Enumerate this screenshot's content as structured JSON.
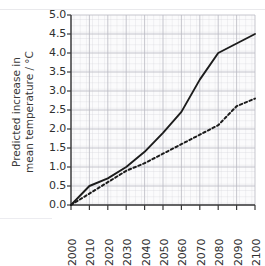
{
  "figure": {
    "cropped_top_text": "",
    "background_color": "#ffffff",
    "ink_color": "#2b2b2b",
    "grid_color": "#c9c9cf"
  },
  "axes": {
    "y_title_line1": "Predicted increase in",
    "y_title_line2": "mean temperature / °C",
    "y_ticks": [
      "5.0",
      "4.5",
      "4.0",
      "3.5",
      "3.0",
      "2.5",
      "2.0",
      "1.5",
      "1.0",
      "0.5",
      "0.0"
    ],
    "x_ticks": [
      "2000",
      "2010",
      "2020",
      "2030",
      "2040",
      "2050",
      "2060",
      "2070",
      "2080",
      "2090",
      "2100"
    ]
  },
  "chart_data": {
    "type": "line",
    "title": "",
    "xlabel": "",
    "ylabel": "Predicted increase in mean temperature / °C",
    "xlim": [
      2000,
      2100
    ],
    "ylim": [
      0.0,
      5.0
    ],
    "y_tick_step": 0.5,
    "x_tick_step": 10,
    "grid": true,
    "minor_grid": true,
    "legend": "none",
    "x": [
      2000,
      2010,
      2020,
      2030,
      2040,
      2050,
      2060,
      2070,
      2080,
      2090,
      2100
    ],
    "series": [
      {
        "name": "Upper prediction (solid)",
        "style": "solid",
        "color": "#1c1c1c",
        "values": [
          0.0,
          0.5,
          0.7,
          1.0,
          1.4,
          1.9,
          2.45,
          3.3,
          4.0,
          4.25,
          4.5
        ]
      },
      {
        "name": "Lower prediction (dashed)",
        "style": "dashed",
        "color": "#1c1c1c",
        "values": [
          0.0,
          0.3,
          0.6,
          0.9,
          1.1,
          1.35,
          1.6,
          1.85,
          2.1,
          2.6,
          2.8
        ]
      }
    ]
  }
}
